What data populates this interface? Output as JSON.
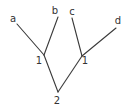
{
  "diagram": {
    "type": "tree",
    "leaves": [
      {
        "id": "a",
        "label": "a",
        "x": 13,
        "y": 22
      },
      {
        "id": "b",
        "label": "b",
        "x": 55,
        "y": 14
      },
      {
        "id": "c",
        "label": "c",
        "x": 72,
        "y": 15
      },
      {
        "id": "d",
        "label": "d",
        "x": 118,
        "y": 24
      }
    ],
    "internal_nodes": [
      {
        "id": "left",
        "label": "1",
        "x": 44,
        "y": 55,
        "label_x": 39,
        "label_y": 64
      },
      {
        "id": "right",
        "label": "1",
        "x": 82,
        "y": 56,
        "label_x": 85,
        "label_y": 64
      },
      {
        "id": "root",
        "label": "2",
        "x": 58,
        "y": 92,
        "label_x": 57,
        "label_y": 104
      }
    ],
    "edges": [
      {
        "from": "a",
        "to": "left",
        "x1": 17,
        "y1": 24,
        "x2": 44,
        "y2": 55
      },
      {
        "from": "b",
        "to": "left",
        "x1": 58,
        "y1": 17,
        "x2": 44,
        "y2": 55
      },
      {
        "from": "c",
        "to": "right",
        "x1": 72,
        "y1": 18,
        "x2": 82,
        "y2": 56
      },
      {
        "from": "d",
        "to": "right",
        "x1": 116,
        "y1": 28,
        "x2": 82,
        "y2": 56
      },
      {
        "from": "left",
        "to": "root",
        "x1": 44,
        "y1": 55,
        "x2": 58,
        "y2": 92
      },
      {
        "from": "right",
        "to": "root",
        "x1": 82,
        "y1": 56,
        "x2": 58,
        "y2": 92
      }
    ],
    "colors": {
      "line": "#3a3a3a",
      "text": "#333333",
      "background": "#ffffff"
    }
  }
}
